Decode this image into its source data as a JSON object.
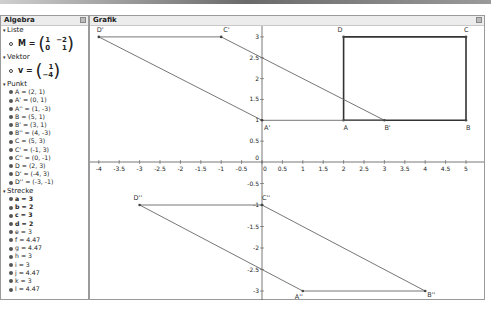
{
  "algebra": {
    "title": "Algebra",
    "categories": {
      "liste": {
        "label": "Liste",
        "matrix_name": "M",
        "matrix": [
          [
            "1",
            "−2"
          ],
          [
            "0",
            "1"
          ]
        ]
      },
      "vektor": {
        "label": "Vektor",
        "vector_name": "v",
        "vector": [
          "1",
          "−4"
        ]
      },
      "punkt": {
        "label": "Punkt",
        "items": [
          "A = (2, 1)",
          "A' = (0, 1)",
          "A'' = (1, -3)",
          "B = (5, 1)",
          "B' = (3, 1)",
          "B'' = (4, -3)",
          "C = (5, 3)",
          "C' = (-1, 3)",
          "C'' = (0, -1)",
          "D = (2, 3)",
          "D' = (-4, 3)",
          "D'' = (-3, -1)"
        ]
      },
      "strecke": {
        "label": "Strecke",
        "items": [
          {
            "text": "a = 3",
            "bold": true
          },
          {
            "text": "b = 2",
            "bold": true
          },
          {
            "text": "c = 3",
            "bold": true
          },
          {
            "text": "d = 2",
            "bold": true
          },
          {
            "text": "e = 3",
            "bold": false
          },
          {
            "text": "f = 4.47",
            "bold": false
          },
          {
            "text": "g = 4.47",
            "bold": false
          },
          {
            "text": "h = 3",
            "bold": false
          },
          {
            "text": "i = 3",
            "bold": false
          },
          {
            "text": "j = 4.47",
            "bold": false
          },
          {
            "text": "k = 3",
            "bold": false
          },
          {
            "text": "l = 4.47",
            "bold": false
          }
        ]
      }
    }
  },
  "grafik": {
    "title": "Grafik",
    "x_ticks": [
      "-4",
      "-3.5",
      "-3",
      "-2.5",
      "-2",
      "-1.5",
      "-1",
      "-0.5",
      "0",
      "0.5",
      "1",
      "1.5",
      "2",
      "2.5",
      "3",
      "3.5",
      "4",
      "4.5",
      "5"
    ],
    "y_ticks_pos": [
      "0.5",
      "1",
      "1.5",
      "2",
      "2.5",
      "3"
    ],
    "y_ticks_neg": [
      "-0.5",
      "-1",
      "-1.5",
      "-2",
      "-2.5",
      "-3"
    ],
    "y_zero": "0",
    "point_labels": {
      "A": "A",
      "B": "B",
      "C": "C",
      "D": "D",
      "A1": "A'",
      "B1": "B'",
      "C1": "C'",
      "D1": "D'",
      "A2": "A''",
      "B2": "B''",
      "C2": "C''",
      "D2": "D''"
    }
  },
  "chart_data": {
    "type": "scatter",
    "title": "Grafik",
    "xlabel": "",
    "ylabel": "",
    "xlim": [
      -4,
      5
    ],
    "ylim": [
      -3,
      3
    ],
    "grid": false,
    "series": [
      {
        "name": "ABCD",
        "points": [
          [
            2,
            1
          ],
          [
            5,
            1
          ],
          [
            5,
            3
          ],
          [
            2,
            3
          ]
        ],
        "closed": true
      },
      {
        "name": "A'B'C'D'",
        "points": [
          [
            0,
            1
          ],
          [
            3,
            1
          ],
          [
            -1,
            3
          ],
          [
            -4,
            3
          ]
        ],
        "closed": true
      },
      {
        "name": "A''B''C''D''",
        "points": [
          [
            1,
            -3
          ],
          [
            4,
            -3
          ],
          [
            0,
            -1
          ],
          [
            -3,
            -1
          ]
        ],
        "closed": true
      }
    ]
  }
}
